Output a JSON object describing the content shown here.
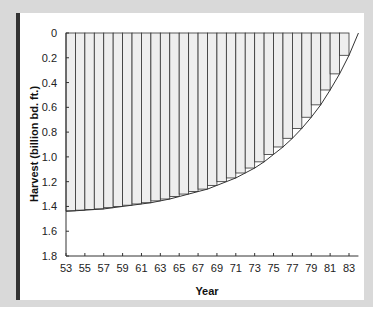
{
  "chart_data": {
    "type": "bar",
    "title": "",
    "xlabel": "Year",
    "ylabel": "Harvest (billion bd. ft.)",
    "y_inverted": true,
    "ylim": [
      0,
      1.8
    ],
    "xlim": [
      53,
      84
    ],
    "grid": false,
    "legend": null,
    "y_ticks": [
      "0",
      "0.2",
      "0.4",
      "0.6",
      "0.8",
      "1.0",
      "1.2",
      "1.4",
      "1.6",
      "1.8"
    ],
    "x_ticks": [
      "53",
      "55",
      "57",
      "59",
      "61",
      "63",
      "65",
      "67",
      "69",
      "71",
      "73",
      "75",
      "77",
      "79",
      "81",
      "83"
    ],
    "categories": [
      53,
      54,
      55,
      56,
      57,
      58,
      59,
      60,
      61,
      62,
      63,
      64,
      65,
      66,
      67,
      68,
      69,
      70,
      71,
      72,
      73,
      74,
      75,
      76,
      77,
      78,
      79,
      80,
      81,
      82,
      83
    ],
    "values": [
      1.44,
      1.435,
      1.43,
      1.425,
      1.42,
      1.41,
      1.4,
      1.39,
      1.38,
      1.37,
      1.355,
      1.34,
      1.32,
      1.3,
      1.28,
      1.26,
      1.23,
      1.2,
      1.17,
      1.13,
      1.09,
      1.04,
      0.98,
      0.92,
      0.85,
      0.77,
      0.68,
      0.58,
      0.46,
      0.33,
      0.18
    ],
    "curve": {
      "end_year": 84,
      "end_value": 0
    },
    "colors": {
      "bar_fill": "#eeeeee",
      "bar_stroke": "#333333",
      "frame": "#d9d9d9",
      "accent_bar": "#333333"
    }
  }
}
